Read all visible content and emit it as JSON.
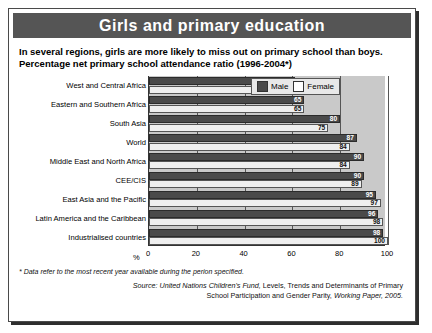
{
  "header": {
    "title": "Girls and primary education"
  },
  "subtitle": {
    "line1": "In several regions, girls are more likely to miss out on primary school than boys.",
    "line2": "Percentage net primary school attendance ratio (1996-2004*)"
  },
  "legend": {
    "male_label": "Male",
    "female_label": "Female"
  },
  "footnote": "* Data refer to the most recent year available during the perion specified.",
  "source": {
    "prefix": "Source:",
    "line1_italic": "United Nations Children's Fund,",
    "line1_rest": "Levels, Trends and Determinants of Primary",
    "line2_rest": "School Participation and Gender Parity,",
    "line2_italic": "Working Paper, 2005."
  },
  "chart_data": {
    "type": "bar",
    "orientation": "horizontal",
    "title": "Girls and primary education",
    "subtitle": "Percentage net primary school attendance ratio (1996-2004*)",
    "xlabel": "%",
    "ylabel": "",
    "xlim": [
      0,
      100
    ],
    "xticks": [
      "0",
      "20",
      "40",
      "60",
      "80",
      "100"
    ],
    "grid": true,
    "legend_position": "top-right",
    "categories": [
      "West and Central Africa",
      "Eastern and Southern Africa",
      "South Asia",
      "World",
      "Middle East and North Africa",
      "CEE/CIS",
      "East Asia and the Pacific",
      "Latin America and the Caribbean",
      "Industrialised countries"
    ],
    "series": [
      {
        "name": "Male",
        "color": "#4a4a4a",
        "values": [
          61,
          65,
          80,
          87,
          90,
          90,
          95,
          96,
          98
        ]
      },
      {
        "name": "Female",
        "color": "#efefef",
        "values": [
          55,
          65,
          75,
          84,
          84,
          89,
          97,
          98,
          100
        ]
      }
    ]
  }
}
